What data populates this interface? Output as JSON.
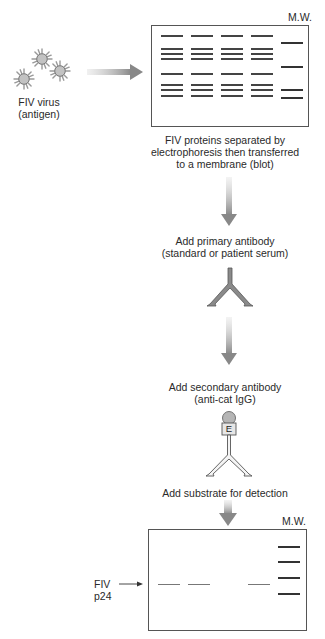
{
  "virus": {
    "label_line1": "FIV virus",
    "label_line2": "(antigen)",
    "icon": "virus-particle-icon",
    "count": 3
  },
  "top_blot": {
    "mw_label": "M.W.",
    "caption_line1": "FIV proteins separated by",
    "caption_line2": "electrophoresis then transferred",
    "caption_line3": "to a membrane (blot)",
    "sample_lanes": 4,
    "sample_band_y": [
      35,
      48,
      53,
      58,
      73,
      84,
      89,
      95
    ],
    "mw_band_y": [
      42,
      66,
      89,
      97
    ]
  },
  "step_primary": {
    "line1": "Add primary antibody",
    "line2": "(standard or patient serum)",
    "icon": "y-antibody-icon"
  },
  "step_secondary": {
    "line1": "Add secondary antibody",
    "line2": "(anti-cat IgG)",
    "enzyme_label": "E",
    "icon": "enzyme-linked-antibody-icon"
  },
  "step_substrate": {
    "line1": "Add substrate for detection"
  },
  "bottom_blot": {
    "mw_label": "M.W.",
    "band_label_line1": "FIV",
    "band_label_line2": "p24",
    "p24_lanes_positive": [
      1,
      2,
      4
    ],
    "p24_band_y": 584,
    "mw_band_y": [
      546,
      561,
      577,
      593
    ]
  },
  "colors": {
    "arrow": "#8a8a8a",
    "band": "#444444",
    "border": "#555555",
    "virus_core": "#b8b8b8",
    "antibody": "#888888"
  }
}
